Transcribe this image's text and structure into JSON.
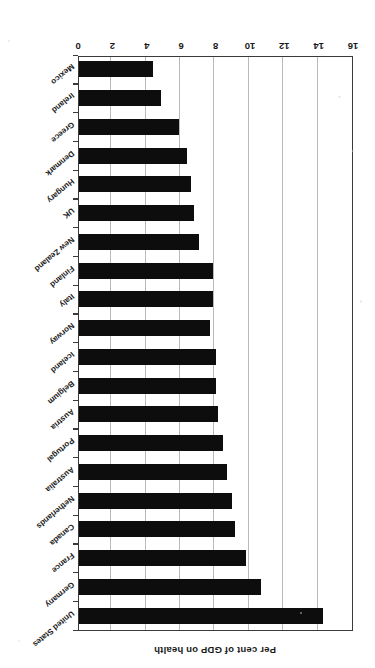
{
  "chart_data": {
    "type": "bar",
    "orientation": "horizontal",
    "title": "",
    "xlabel": "",
    "ylabel": "Per cent of GDP on health",
    "axis_title": "Per cent of GDP on health",
    "xlim": [
      0,
      16
    ],
    "tick_labels": [
      "0",
      "2",
      "4",
      "6",
      "8",
      "10",
      "12",
      "14",
      "16"
    ],
    "tick_values": [
      0,
      2,
      4,
      6,
      8,
      10,
      12,
      14,
      16
    ],
    "grid": true,
    "grid_axis": "value",
    "legend": "none",
    "bar_color": "#0d0d0d",
    "plot_background": "#ffffff",
    "page_rotation_degrees": 180,
    "categories": [
      "United States",
      "Germany",
      "France",
      "Canada",
      "Netherlands",
      "Australia",
      "Portugal",
      "Austria",
      "Belgium",
      "Iceland",
      "Norway",
      "Italy",
      "Finland",
      "New Zealand",
      "UK",
      "Hungary",
      "Denmark",
      "Greece",
      "Ireland",
      "Mexico"
    ],
    "values": [
      14.2,
      10.6,
      9.7,
      9.1,
      8.9,
      8.6,
      8.4,
      8.1,
      8.0,
      8.0,
      7.6,
      7.8,
      7.8,
      7.0,
      6.7,
      6.5,
      6.3,
      5.8,
      4.8,
      4.3
    ],
    "series": [
      {
        "name": "Per cent of GDP on health",
        "values": [
          14.2,
          10.6,
          9.7,
          9.1,
          8.9,
          8.6,
          8.4,
          8.1,
          8.0,
          8.0,
          7.6,
          7.8,
          7.8,
          7.0,
          6.7,
          6.5,
          6.3,
          5.8,
          4.8,
          4.3
        ]
      }
    ]
  }
}
